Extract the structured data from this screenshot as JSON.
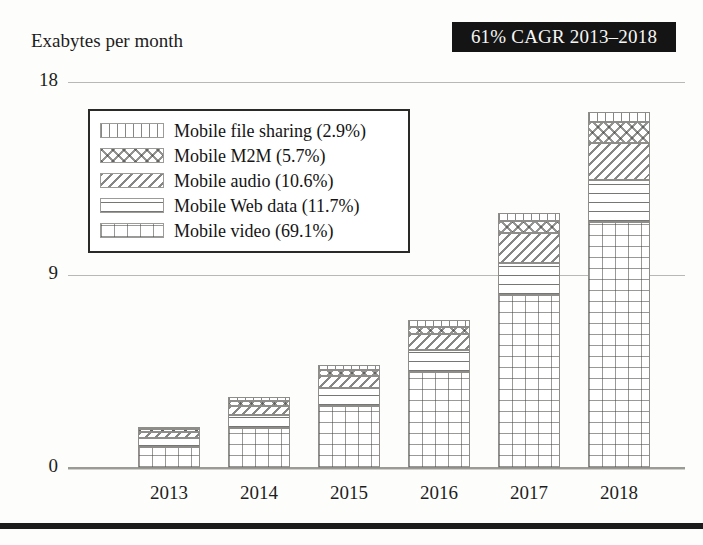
{
  "figure": {
    "axis_title": "Exabytes per month",
    "badge": "61% CAGR 2013–2018"
  },
  "chart_data": {
    "type": "bar",
    "stacked": true,
    "title": "",
    "subtitle": "",
    "xlabel": "",
    "ylabel": "Exabytes per month",
    "ylim": [
      0,
      18
    ],
    "yticks": [
      0,
      9,
      18
    ],
    "ytick_labels": [
      "0",
      "9",
      "18"
    ],
    "grid": true,
    "legend_position": "upper-left-inside",
    "annotations": [
      "61% CAGR 2013–2018"
    ],
    "categories": [
      "2013",
      "2014",
      "2015",
      "2016",
      "2017",
      "2018"
    ],
    "series": [
      {
        "name": "Mobile video (69.1%)",
        "share_pct": 69.1,
        "pattern": "grid",
        "values": [
          0.96,
          1.86,
          2.87,
          4.47,
          8.08,
          11.47
        ]
      },
      {
        "name": "Mobile Web data (11.7%)",
        "share_pct": 11.7,
        "pattern": "horizontal-lines",
        "values": [
          0.42,
          0.63,
          0.84,
          1.03,
          1.5,
          1.94
        ]
      },
      {
        "name": "Mobile audio (10.6%)",
        "share_pct": 10.6,
        "pattern": "diagonal-lines",
        "values": [
          0.28,
          0.42,
          0.56,
          0.75,
          1.4,
          1.76
        ]
      },
      {
        "name": "Mobile M2M (5.7%)",
        "share_pct": 5.7,
        "pattern": "crosshatch-diamond",
        "values": [
          0.14,
          0.21,
          0.28,
          0.33,
          0.52,
          0.95
        ]
      },
      {
        "name": "Mobile file sharing (2.9%)",
        "share_pct": 2.9,
        "pattern": "vertical-lines",
        "values": [
          0.1,
          0.18,
          0.25,
          0.32,
          0.4,
          0.48
        ]
      }
    ],
    "totals": [
      1.9,
      3.3,
      4.8,
      6.9,
      11.9,
      16.6
    ]
  },
  "legend": {
    "items": [
      {
        "label": "Mobile file sharing (2.9%)",
        "pattern": "vertical-lines"
      },
      {
        "label": "Mobile M2M (5.7%)",
        "pattern": "crosshatch-diamond"
      },
      {
        "label": "Mobile audio (10.6%)",
        "pattern": "diagonal-lines"
      },
      {
        "label": "Mobile Web data (11.7%)",
        "pattern": "horizontal-lines"
      },
      {
        "label": "Mobile video (69.1%)",
        "pattern": "grid"
      }
    ]
  },
  "colors": {
    "badge_background": "#141414",
    "badge_text": "#f6f6f4",
    "text": "#1a1a1a",
    "gridline": "#b9b8b4",
    "bar_outline": "#8e8d89",
    "background": "#fdfdfc",
    "footer_rule": "#1b1b1b"
  }
}
